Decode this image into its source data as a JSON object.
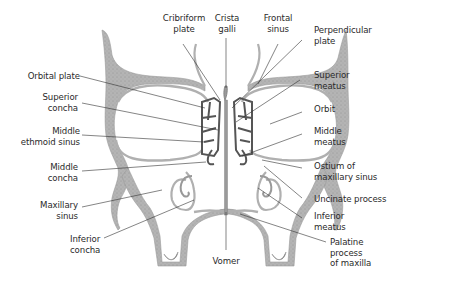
{
  "diagram": {
    "type": "anatomical coronal section",
    "colors": {
      "bone_fill": "#b4b4b4",
      "bone_edge": "#8a8a8a",
      "ethmoid_lines": "#555555",
      "leader_lines": "#333333",
      "text": "#2a2a2a",
      "background": "#ffffff"
    }
  },
  "labels": {
    "cribriform_plate": "Cribriform\nplate",
    "crista_galli": "Crista\ngalli",
    "frontal_sinus": "Frontal\nsinus",
    "perpendicular_plate": "Perpendicular\nplate",
    "orbital_plate": "Orbital plate",
    "superior_concha": "Superior\nconcha",
    "superior_meatus": "Superior\nmeatus",
    "orbit": "Orbit",
    "middle_ethmoid_sinus": "Middle\nethmoid sinus",
    "middle_meatus": "Middle\nmeatus",
    "middle_concha": "Middle\nconcha",
    "ostium_maxillary_sinus": "Ostium of\nmaxillary sinus",
    "uncinate_process": "Uncinate process",
    "maxillary_sinus": "Maxillary\nsinus",
    "inferior_meatus": "Inferior\nmeatus",
    "inferior_concha": "Inferior\nconcha",
    "vomer": "Vomer",
    "palatine_process": "Palatine\nprocess\nof maxilla"
  }
}
